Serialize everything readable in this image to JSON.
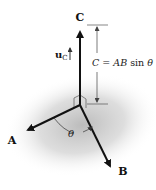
{
  "diagram": {
    "vectors": [
      {
        "name": "C",
        "label": "C",
        "from": [
          80,
          105
        ],
        "to": [
          80,
          26
        ]
      },
      {
        "name": "A",
        "label": "A",
        "from": [
          80,
          105
        ],
        "to": [
          22,
          133
        ]
      },
      {
        "name": "B",
        "label": "B",
        "from": [
          80,
          105
        ],
        "to": [
          113,
          172
        ]
      }
    ],
    "unit_vector": {
      "base": "u",
      "subscript": "C"
    },
    "magnitude_formula": {
      "lhs": "C",
      "eq": " = ",
      "rhs_vars": "AB",
      "rhs_func": " sin ",
      "rhs_angle": "θ"
    },
    "angle_label": "θ",
    "colors": {
      "vector": "#111111",
      "dimension_line": "#444444",
      "shadow": "#bdbdbd",
      "background": "#ffffff"
    }
  }
}
